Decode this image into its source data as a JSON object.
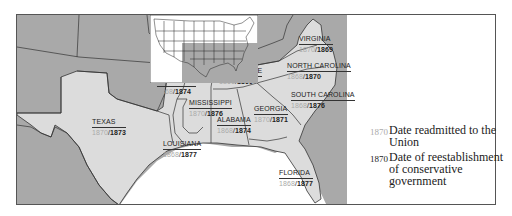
{
  "map": {
    "title": "Reconstruction in the South",
    "colors": {
      "other_states": "#a9a9a9",
      "confederate_states": "#dcdcdc",
      "water": "#ffffff",
      "border": "#333333",
      "readmit_date": "#aaaaaa",
      "conservative_date": "#222222"
    },
    "states": [
      {
        "name": "VIRGINIA",
        "readmitted": "1870",
        "conservative": "1869"
      },
      {
        "name": "NORTH CAROLINA",
        "readmitted": "1868",
        "conservative": "1870"
      },
      {
        "name": "TENNESSEE",
        "readmitted": "1866",
        "conservative": "1869"
      },
      {
        "name": "ARKANSAS",
        "readmitted": "1868",
        "conservative": "1874"
      },
      {
        "name": "SOUTH CAROLINA",
        "readmitted": "1868",
        "conservative": "1876"
      },
      {
        "name": "MISSISSIPPI",
        "readmitted": "1870",
        "conservative": "1876"
      },
      {
        "name": "GEORGIA",
        "readmitted": "1870",
        "conservative": "1871"
      },
      {
        "name": "ALABAMA",
        "readmitted": "1868",
        "conservative": "1874"
      },
      {
        "name": "TEXAS",
        "readmitted": "1870",
        "conservative": "1873"
      },
      {
        "name": "LOUISIANA",
        "readmitted": "1868",
        "conservative": "1877"
      },
      {
        "name": "FLORIDA",
        "readmitted": "1868",
        "conservative": "1877"
      }
    ],
    "separator": "/"
  },
  "legend": {
    "items": [
      {
        "year": "1870",
        "label": "Date readmitted to the Union"
      },
      {
        "year": "1870",
        "label": "Date of reestablishment of conservative government"
      }
    ]
  },
  "inset": {
    "label": "United States locator map"
  }
}
